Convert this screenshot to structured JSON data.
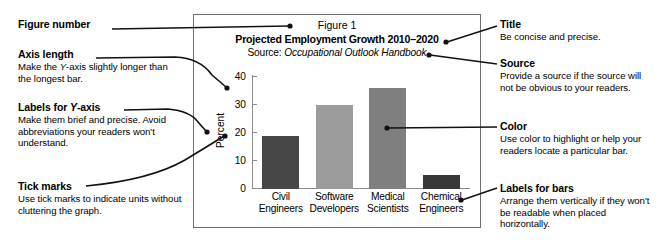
{
  "figure": {
    "figure_number": "Figure 1",
    "title": "Projected Employment Growth 2010–2020",
    "source_prefix": "Source: ",
    "source_name": "Occupational Outlook Handbook"
  },
  "chart_data": {
    "type": "bar",
    "title": "Projected Employment Growth 2010–2020",
    "categories": [
      "Civil Engineers",
      "Software Developers",
      "Medical Scientists",
      "Chemical Engineers"
    ],
    "category_lines": [
      [
        "Civil",
        "Engineers"
      ],
      [
        "Software",
        "Developers"
      ],
      [
        "Medical",
        "Scientists"
      ],
      [
        "Chemical",
        "Engineers"
      ]
    ],
    "values": [
      19,
      30,
      36,
      5
    ],
    "xlabel": "",
    "ylabel": "Percent",
    "ylim": [
      0,
      40
    ],
    "yticks": [
      0,
      10,
      20,
      30,
      40
    ],
    "ytick_labels": [
      "0",
      "10",
      "20",
      "30",
      "40"
    ],
    "grid": false,
    "legend": false,
    "bar_colors": [
      "#474747",
      "#9b9b9b",
      "#7f7f7f",
      "#373737"
    ],
    "axis_color": "#8a8a8a"
  },
  "annotations": {
    "left": [
      {
        "id": "figure-number",
        "title": "Figure number",
        "body": ""
      },
      {
        "id": "axis-length",
        "title": "Axis length",
        "body": "Make the Y-axis slightly longer than the longest bar."
      },
      {
        "id": "labels-for-y-axis",
        "title": "Labels for Y-axis",
        "body": "Make them brief and precise. Avoid abbreviations your readers won't understand."
      },
      {
        "id": "tick-marks",
        "title": "Tick marks",
        "body": "Use tick marks to indicate units without cluttering the graph."
      }
    ],
    "right": [
      {
        "id": "title",
        "title": "Title",
        "body": "Be concise and precise."
      },
      {
        "id": "source",
        "title": "Source",
        "body": "Provide a source if the source will not be obvious to your readers."
      },
      {
        "id": "color",
        "title": "Color",
        "body": "Use color to highlight or help your readers locate a particular bar."
      },
      {
        "id": "labels-for-bars",
        "title": "Labels for bars",
        "body": "Arrange them vertically if they won't be readable when placed horizontally."
      }
    ]
  },
  "colors": {
    "ink": "#000000",
    "box_border": "#6e6e6e",
    "axis": "#8a8a8a",
    "leader": "#111111"
  }
}
